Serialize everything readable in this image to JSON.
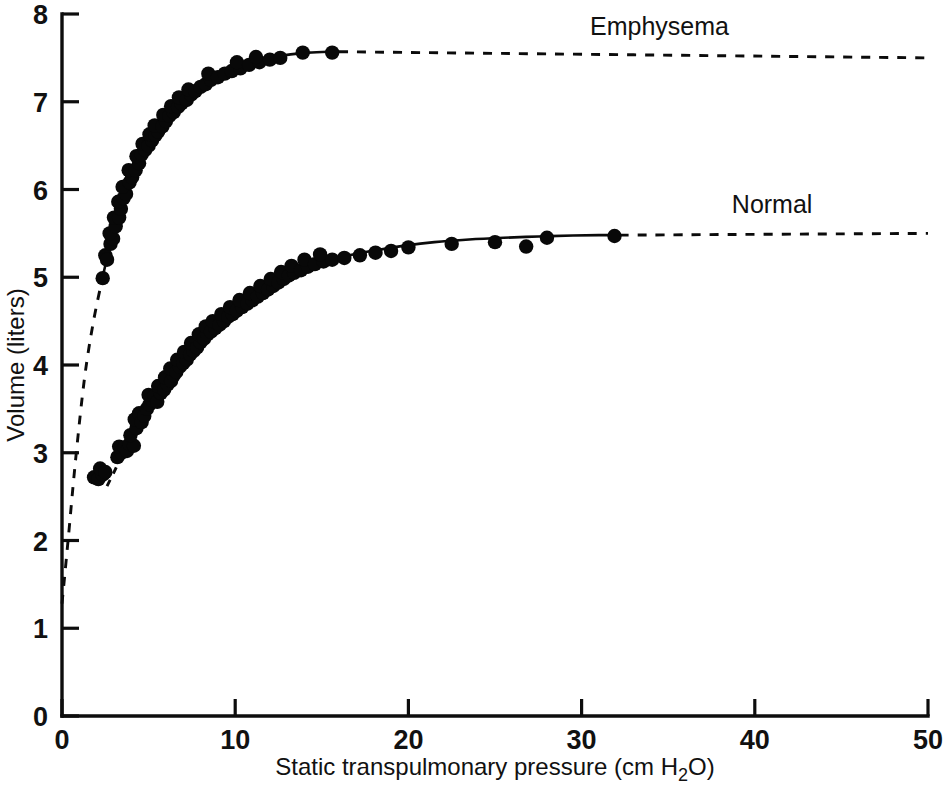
{
  "chart_data": {
    "type": "scatter",
    "title": "",
    "xlabel": "Static transpulmonary pressure (cm H2O)",
    "xlabel_parts": {
      "main": "Static transpulmonary pressure (cm H",
      "sub": "2",
      "tail": "O)"
    },
    "ylabel": "Volume (liters)",
    "xlim": [
      0,
      50
    ],
    "ylim": [
      0,
      8
    ],
    "xticks": [
      0,
      10,
      20,
      30,
      40,
      50
    ],
    "yticks": [
      0,
      1,
      2,
      3,
      4,
      5,
      6,
      7,
      8
    ],
    "xticklabels": [
      "0",
      "10",
      "20",
      "30",
      "40",
      "50"
    ],
    "yticklabels": [
      "0",
      "1",
      "2",
      "3",
      "4",
      "5",
      "6",
      "7",
      "8"
    ],
    "grid": false,
    "legend_position": "inline-right-of-curve",
    "annotations": [
      {
        "text": "Emphysema",
        "x": 34.5,
        "y": 7.76
      },
      {
        "text": "Normal",
        "x": 41.0,
        "y": 5.73
      }
    ],
    "series": [
      {
        "name": "Emphysema",
        "marker": "filled-circle",
        "color": "#080808",
        "fit_solid": {
          "x": [
            2.3,
            2.6,
            2.9,
            3.2,
            3.6,
            4.0,
            4.5,
            5.0,
            5.6,
            6.2,
            6.9,
            7.6,
            8.4,
            9.3,
            10.2,
            11.2,
            12.2,
            13.2,
            14.2,
            15.4,
            16.0
          ],
          "y": [
            4.96,
            5.22,
            5.45,
            5.66,
            5.88,
            6.08,
            6.3,
            6.49,
            6.68,
            6.84,
            6.99,
            7.11,
            7.23,
            7.33,
            7.41,
            7.47,
            7.51,
            7.54,
            7.56,
            7.57,
            7.57
          ]
        },
        "fit_dashed_low": {
          "x": [
            0.0,
            0.35,
            0.8,
            1.3,
            1.8,
            2.3
          ],
          "y": [
            1.28,
            2.0,
            2.95,
            3.85,
            4.48,
            4.96
          ]
        },
        "fit_dashed_high": {
          "x": [
            16.0,
            50.0
          ],
          "y": [
            7.57,
            7.5
          ]
        },
        "points": [
          [
            2.35,
            4.99
          ],
          [
            2.5,
            5.25
          ],
          [
            2.6,
            5.2
          ],
          [
            2.8,
            5.38
          ],
          [
            2.95,
            5.44
          ],
          [
            2.75,
            5.5
          ],
          [
            3.1,
            5.58
          ],
          [
            3.0,
            5.68
          ],
          [
            3.3,
            5.68
          ],
          [
            3.4,
            5.78
          ],
          [
            3.25,
            5.86
          ],
          [
            3.55,
            5.9
          ],
          [
            3.7,
            5.95
          ],
          [
            3.5,
            6.03
          ],
          [
            3.9,
            6.08
          ],
          [
            4.05,
            6.14
          ],
          [
            3.85,
            6.22
          ],
          [
            4.25,
            6.22
          ],
          [
            4.45,
            6.3
          ],
          [
            4.3,
            6.38
          ],
          [
            4.6,
            6.4
          ],
          [
            4.8,
            6.45
          ],
          [
            4.65,
            6.52
          ],
          [
            5.0,
            6.5
          ],
          [
            5.2,
            6.56
          ],
          [
            5.05,
            6.63
          ],
          [
            5.4,
            6.62
          ],
          [
            5.55,
            6.66
          ],
          [
            5.35,
            6.73
          ],
          [
            5.8,
            6.72
          ],
          [
            6.0,
            6.78
          ],
          [
            5.85,
            6.85
          ],
          [
            6.2,
            6.84
          ],
          [
            6.45,
            6.88
          ],
          [
            6.3,
            6.95
          ],
          [
            6.7,
            6.94
          ],
          [
            6.9,
            6.98
          ],
          [
            6.75,
            7.05
          ],
          [
            7.2,
            7.02
          ],
          [
            7.45,
            7.08
          ],
          [
            7.3,
            7.14
          ],
          [
            7.7,
            7.12
          ],
          [
            8.0,
            7.17
          ],
          [
            8.3,
            7.2
          ],
          [
            8.6,
            7.25
          ],
          [
            8.45,
            7.32
          ],
          [
            9.0,
            7.28
          ],
          [
            9.4,
            7.32
          ],
          [
            9.8,
            7.35
          ],
          [
            10.3,
            7.38
          ],
          [
            10.1,
            7.45
          ],
          [
            10.8,
            7.42
          ],
          [
            11.4,
            7.45
          ],
          [
            11.2,
            7.51
          ],
          [
            12.0,
            7.48
          ],
          [
            12.6,
            7.5
          ],
          [
            13.9,
            7.56
          ],
          [
            15.6,
            7.56
          ]
        ]
      },
      {
        "name": "Normal",
        "marker": "filled-circle",
        "color": "#080808",
        "fit_solid": {
          "x": [
            4.0,
            4.6,
            5.2,
            5.9,
            6.6,
            7.3,
            8.0,
            8.8,
            9.6,
            10.4,
            11.3,
            12.2,
            13.2,
            14.3,
            15.5,
            16.8,
            18.2,
            19.8,
            21.5,
            23.5,
            25.5,
            27.5,
            29.5,
            31.0,
            32.2
          ],
          "y": [
            3.25,
            3.45,
            3.65,
            3.85,
            4.02,
            4.2,
            4.34,
            4.48,
            4.62,
            4.74,
            4.86,
            4.96,
            5.05,
            5.13,
            5.2,
            5.26,
            5.31,
            5.36,
            5.4,
            5.43,
            5.45,
            5.465,
            5.475,
            5.48,
            5.48
          ]
        },
        "fit_dashed_low": {
          "x": [
            2.6,
            3.1,
            3.6,
            4.0
          ],
          "y": [
            2.62,
            2.82,
            3.05,
            3.25
          ]
        },
        "fit_dashed_high": {
          "x": [
            32.2,
            50.0
          ],
          "y": [
            5.48,
            5.5
          ]
        },
        "points": [
          [
            1.85,
            2.72
          ],
          [
            2.1,
            2.7
          ],
          [
            2.35,
            2.75
          ],
          [
            2.2,
            2.82
          ],
          [
            2.5,
            2.78
          ],
          [
            3.2,
            2.95
          ],
          [
            3.45,
            3.0
          ],
          [
            3.3,
            3.07
          ],
          [
            3.6,
            3.06
          ],
          [
            3.75,
            3.02
          ],
          [
            3.9,
            3.1
          ],
          [
            4.15,
            3.08
          ],
          [
            3.95,
            3.2
          ],
          [
            4.3,
            3.28
          ],
          [
            4.2,
            3.38
          ],
          [
            4.45,
            3.45
          ],
          [
            4.6,
            3.35
          ],
          [
            4.75,
            3.42
          ],
          [
            4.9,
            3.5
          ],
          [
            5.05,
            3.55
          ],
          [
            5.2,
            3.6
          ],
          [
            5.0,
            3.66
          ],
          [
            5.35,
            3.65
          ],
          [
            5.5,
            3.58
          ],
          [
            5.7,
            3.68
          ],
          [
            5.55,
            3.76
          ],
          [
            5.9,
            3.72
          ],
          [
            6.1,
            3.78
          ],
          [
            5.95,
            3.86
          ],
          [
            6.3,
            3.82
          ],
          [
            6.45,
            3.88
          ],
          [
            6.25,
            3.96
          ],
          [
            6.6,
            3.92
          ],
          [
            6.8,
            3.98
          ],
          [
            6.65,
            4.06
          ],
          [
            7.0,
            4.02
          ],
          [
            7.2,
            4.06
          ],
          [
            7.05,
            4.15
          ],
          [
            7.4,
            4.12
          ],
          [
            7.6,
            4.16
          ],
          [
            7.45,
            4.25
          ],
          [
            7.8,
            4.2
          ],
          [
            8.0,
            4.26
          ],
          [
            7.9,
            4.35
          ],
          [
            8.2,
            4.3
          ],
          [
            8.4,
            4.35
          ],
          [
            8.3,
            4.44
          ],
          [
            8.6,
            4.38
          ],
          [
            8.85,
            4.42
          ],
          [
            8.7,
            4.5
          ],
          [
            9.1,
            4.46
          ],
          [
            9.35,
            4.5
          ],
          [
            9.2,
            4.58
          ],
          [
            9.6,
            4.55
          ],
          [
            9.85,
            4.58
          ],
          [
            9.7,
            4.66
          ],
          [
            10.1,
            4.62
          ],
          [
            10.4,
            4.66
          ],
          [
            10.25,
            4.74
          ],
          [
            10.7,
            4.7
          ],
          [
            11.0,
            4.74
          ],
          [
            10.85,
            4.82
          ],
          [
            11.3,
            4.78
          ],
          [
            11.6,
            4.82
          ],
          [
            11.45,
            4.9
          ],
          [
            11.9,
            4.86
          ],
          [
            12.2,
            4.9
          ],
          [
            12.05,
            4.98
          ],
          [
            12.5,
            4.94
          ],
          [
            12.8,
            4.98
          ],
          [
            12.65,
            5.06
          ],
          [
            13.1,
            5.02
          ],
          [
            13.4,
            5.05
          ],
          [
            13.25,
            5.13
          ],
          [
            13.8,
            5.08
          ],
          [
            14.2,
            5.12
          ],
          [
            14.0,
            5.2
          ],
          [
            14.6,
            5.15
          ],
          [
            15.1,
            5.18
          ],
          [
            14.9,
            5.26
          ],
          [
            15.6,
            5.2
          ],
          [
            16.3,
            5.22
          ],
          [
            17.2,
            5.25
          ],
          [
            18.1,
            5.28
          ],
          [
            19.0,
            5.3
          ],
          [
            20.0,
            5.34
          ],
          [
            22.5,
            5.38
          ],
          [
            25.0,
            5.4
          ],
          [
            26.8,
            5.35
          ],
          [
            28.0,
            5.45
          ],
          [
            31.9,
            5.47
          ]
        ]
      }
    ]
  }
}
